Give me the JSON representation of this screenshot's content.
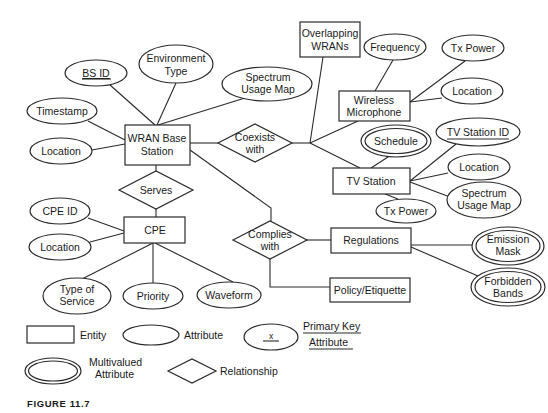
{
  "diagram": {
    "entities": {
      "wran_base_station": [
        "WRAN Base",
        "Station"
      ],
      "overlapping_wrans": [
        "Overlapping",
        "WRANs"
      ],
      "wireless_microphone": [
        "Wireless",
        "Microphone"
      ],
      "tv_station": [
        "TV Station"
      ],
      "cpe": [
        "CPE"
      ],
      "regulations": [
        "Regulations"
      ],
      "policy_etiquette": [
        "Policy/Etiquette"
      ]
    },
    "relationships": {
      "coexists_with": [
        "Coexists",
        "with"
      ],
      "serves": [
        "Serves"
      ],
      "complies_with": [
        "Complies",
        "with"
      ]
    },
    "attributes": {
      "bs_id": [
        "BS ID"
      ],
      "environment_type": [
        "Environment",
        "Type"
      ],
      "spectrum_usage_map_bs": [
        "Spectrum",
        "Usage Map"
      ],
      "timestamp": [
        "Timestamp"
      ],
      "location_bs": [
        "Location"
      ],
      "frequency": [
        "Frequency"
      ],
      "tx_power_mic": [
        "Tx Power"
      ],
      "location_mic": [
        "Location"
      ],
      "schedule": [
        "Schedule"
      ],
      "tv_station_id": [
        "TV Station ID"
      ],
      "location_tv": [
        "Location"
      ],
      "spectrum_usage_map_tv": [
        "Spectrum",
        "Usage Map"
      ],
      "tx_power_tv": [
        "Tx Power"
      ],
      "cpe_id": [
        "CPE ID"
      ],
      "location_cpe": [
        "Location"
      ],
      "type_of_service": [
        "Type of",
        "Service"
      ],
      "priority": [
        "Priority"
      ],
      "waveform": [
        "Waveform"
      ],
      "emission_mask": [
        "Emission",
        "Mask"
      ],
      "forbidden_bands": [
        "Forbidden",
        "Bands"
      ]
    },
    "primary_keys": [
      "BS ID",
      "TV Station ID"
    ],
    "multivalued": [
      "Schedule",
      "Emission Mask",
      "Forbidden Bands"
    ]
  },
  "legend": {
    "entity": "Entity",
    "attribute": "Attribute",
    "primary_key_symbol": "x",
    "primary_key": [
      "Primary Key",
      "Attribute"
    ],
    "multivalued": [
      "Multivalued",
      "Attribute"
    ],
    "relationship": "Relationship"
  },
  "caption": "FIGURE 11.7"
}
